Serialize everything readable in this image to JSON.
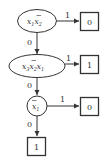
{
  "diagram": {
    "type": "binary-decision-diagram",
    "nodes": [
      {
        "id": "n1",
        "shape": "ellipse",
        "terms": [
          {
            "var": "x",
            "sub": "1",
            "negated": false
          },
          {
            "var": "x",
            "sub": "2",
            "negated": true
          }
        ]
      },
      {
        "id": "n2",
        "shape": "ellipse",
        "terms": [
          {
            "var": "x",
            "sub": "3",
            "negated": false
          },
          {
            "var": "x",
            "sub": "2",
            "negated": true
          },
          {
            "var": "x",
            "sub": "1",
            "negated": false
          }
        ]
      },
      {
        "id": "n3",
        "shape": "circle",
        "terms": [
          {
            "var": "x",
            "sub": "1",
            "negated": true
          }
        ]
      }
    ],
    "leaves": [
      {
        "id": "l1",
        "label": "0"
      },
      {
        "id": "l2",
        "label": "1"
      },
      {
        "id": "l3",
        "label": "0"
      },
      {
        "id": "l4",
        "label": "1"
      }
    ],
    "edges": [
      {
        "from": "n1",
        "to": "l1",
        "label": "1"
      },
      {
        "from": "n1",
        "to": "n2",
        "label": "0"
      },
      {
        "from": "n2",
        "to": "l2",
        "label": "1"
      },
      {
        "from": "n2",
        "to": "n3",
        "label": "0"
      },
      {
        "from": "n3",
        "to": "l3",
        "label": "1"
      },
      {
        "from": "n3",
        "to": "l4",
        "label": "0"
      }
    ]
  }
}
